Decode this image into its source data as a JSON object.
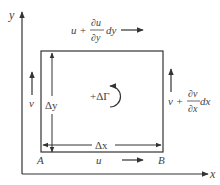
{
  "diagram": {
    "axes": {
      "x_label": "x",
      "y_label": "y"
    },
    "corners": {
      "bottom_left": "A",
      "bottom_right": "B"
    },
    "velocities": {
      "bottom": "u",
      "left": "v",
      "top": {
        "base": "u +",
        "num": "∂u",
        "den": "∂y",
        "tail": "dy"
      },
      "right": {
        "base": "v +",
        "num": "∂v",
        "den": "∂x",
        "tail": "dx"
      }
    },
    "dimensions": {
      "width": "Δx",
      "height": "Δy"
    },
    "circulation": {
      "label": "+ΔΓ",
      "direction": "counterclockwise"
    },
    "colors": {
      "line": "#333333",
      "text": "#444444",
      "background": "#ffffff"
    }
  }
}
